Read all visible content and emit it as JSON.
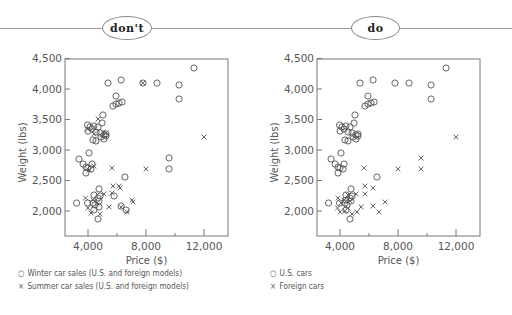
{
  "banner": {
    "left_label": "don't",
    "right_label": "do"
  },
  "colors": {
    "ink": "#555555",
    "axis": "#777777",
    "banner_line": "#9a9a9a"
  },
  "axes": {
    "x_label": "Price ($)",
    "y_label": "Weight (lbs)",
    "x_ticks": [
      "4,000",
      "8,000",
      "12,000"
    ],
    "y_ticks": [
      "2,000",
      "2,500",
      "3,000",
      "3,500",
      "4,000",
      "4,500"
    ]
  },
  "legends": {
    "left": [
      {
        "symbol": "○",
        "text": "Winter car sales (U.S. and foreign models)"
      },
      {
        "symbol": "×",
        "text": "Summer car sales (U.S. and foreign models)"
      }
    ],
    "right": [
      {
        "symbol": "○",
        "text": "U.S. cars"
      },
      {
        "symbol": "×",
        "text": "Foreign cars"
      }
    ]
  },
  "chart_data": [
    {
      "type": "scatter",
      "panel": "don't",
      "title": "",
      "xlabel": "Price ($)",
      "ylabel": "Weight (lbs)",
      "xlim": [
        2600,
        13600
      ],
      "ylim": [
        1600,
        4500
      ],
      "x_ticks": [
        4000,
        8000,
        12000
      ],
      "x_minor_ticks": [
        6000,
        10000
      ],
      "y_ticks": [
        2000,
        2500,
        3000,
        3500,
        4000,
        4500
      ],
      "grid": false,
      "legend_position": "below",
      "series": [
        {
          "name": "Winter car sales (U.S. and foreign models)",
          "marker": "circle",
          "points": [
            [
              11310,
              4344
            ],
            [
              7790,
              4098
            ],
            [
              8760,
              4098
            ],
            [
              10280,
              4066
            ],
            [
              10280,
              3836
            ],
            [
              5380,
              4098
            ],
            [
              6280,
              4148
            ],
            [
              5930,
              3885
            ],
            [
              5720,
              3721
            ],
            [
              5930,
              3754
            ],
            [
              6140,
              3770
            ],
            [
              6350,
              3787
            ],
            [
              5030,
              3574
            ],
            [
              4970,
              3443
            ],
            [
              3970,
              3410
            ],
            [
              4140,
              3377
            ],
            [
              4410,
              3394
            ],
            [
              4690,
              3377
            ],
            [
              4000,
              3311
            ],
            [
              4280,
              3344
            ],
            [
              4550,
              3295
            ],
            [
              4830,
              3279
            ],
            [
              5100,
              3246
            ],
            [
              5240,
              3262
            ],
            [
              5240,
              3230
            ],
            [
              4900,
              3213
            ],
            [
              5100,
              3180
            ],
            [
              4550,
              3148
            ],
            [
              4340,
              3164
            ],
            [
              4070,
              2951
            ],
            [
              3380,
              2852
            ],
            [
              3660,
              2770
            ],
            [
              3860,
              2721
            ],
            [
              4000,
              2705
            ],
            [
              3860,
              2623
            ],
            [
              4210,
              2689
            ],
            [
              4280,
              2770
            ],
            [
              6550,
              2557
            ],
            [
              4760,
              2361
            ],
            [
              4410,
              2262
            ],
            [
              4690,
              2213
            ],
            [
              4830,
              2246
            ],
            [
              3970,
              2131
            ],
            [
              4340,
              2131
            ],
            [
              4480,
              2098
            ],
            [
              4760,
              2164
            ],
            [
              4410,
              2016
            ],
            [
              4690,
              1869
            ],
            [
              9590,
              2689
            ],
            [
              9590,
              2869
            ],
            [
              3210,
              2131
            ],
            [
              6280,
              2082
            ],
            [
              5800,
              2246
            ],
            [
              6630,
              2016
            ],
            [
              4760,
              2066
            ]
          ]
        },
        {
          "name": "Summer car sales (U.S. and foreign models)",
          "marker": "x",
          "points": [
            [
              12000,
              3213
            ],
            [
              8000,
              2689
            ],
            [
              7790,
              4098
            ],
            [
              4690,
              3508
            ],
            [
              3970,
              3344
            ],
            [
              4410,
              3262
            ],
            [
              5030,
              3295
            ],
            [
              5720,
              2410
            ],
            [
              5650,
              2705
            ],
            [
              6140,
              2410
            ],
            [
              5650,
              2295
            ],
            [
              6210,
              2377
            ],
            [
              7030,
              2180
            ],
            [
              5450,
              2066
            ],
            [
              3830,
              2213
            ],
            [
              4000,
              2049
            ],
            [
              4210,
              1967
            ],
            [
              4630,
              2131
            ],
            [
              4830,
              1951
            ],
            [
              5100,
              2279
            ],
            [
              6280,
              2066
            ],
            [
              6690,
              1984
            ],
            [
              7100,
              2148
            ],
            [
              4340,
              2180
            ],
            [
              4070,
              2672
            ],
            [
              4410,
              2738
            ],
            [
              5240,
              3279
            ]
          ]
        }
      ]
    },
    {
      "type": "scatter",
      "panel": "do",
      "title": "",
      "xlabel": "Price ($)",
      "ylabel": "Weight (lbs)",
      "xlim": [
        2600,
        13600
      ],
      "ylim": [
        1600,
        4500
      ],
      "x_ticks": [
        4000,
        8000,
        12000
      ],
      "x_minor_ticks": [
        6000,
        10000
      ],
      "y_ticks": [
        2000,
        2500,
        3000,
        3500,
        4000,
        4500
      ],
      "grid": false,
      "legend_position": "below",
      "series": [
        {
          "name": "U.S. cars",
          "marker": "circle",
          "points": [
            [
              11310,
              4344
            ],
            [
              7790,
              4098
            ],
            [
              8760,
              4098
            ],
            [
              10280,
              4066
            ],
            [
              10280,
              3836
            ],
            [
              5380,
              4098
            ],
            [
              6280,
              4148
            ],
            [
              5930,
              3885
            ],
            [
              5720,
              3721
            ],
            [
              5930,
              3754
            ],
            [
              6140,
              3770
            ],
            [
              6350,
              3787
            ],
            [
              5030,
              3574
            ],
            [
              4970,
              3443
            ],
            [
              3970,
              3410
            ],
            [
              4140,
              3377
            ],
            [
              4410,
              3394
            ],
            [
              4690,
              3377
            ],
            [
              4000,
              3311
            ],
            [
              4280,
              3344
            ],
            [
              4550,
              3295
            ],
            [
              4830,
              3279
            ],
            [
              5100,
              3246
            ],
            [
              5240,
              3262
            ],
            [
              5240,
              3230
            ],
            [
              4900,
              3213
            ],
            [
              5100,
              3180
            ],
            [
              4550,
              3148
            ],
            [
              4340,
              3164
            ],
            [
              4070,
              2951
            ],
            [
              3380,
              2852
            ],
            [
              3660,
              2770
            ],
            [
              3860,
              2721
            ],
            [
              4000,
              2705
            ],
            [
              3860,
              2623
            ],
            [
              4210,
              2689
            ],
            [
              4280,
              2770
            ],
            [
              6550,
              2557
            ],
            [
              4760,
              2361
            ],
            [
              4410,
              2262
            ],
            [
              4690,
              2213
            ],
            [
              4830,
              2246
            ],
            [
              3970,
              2131
            ],
            [
              4340,
              2131
            ],
            [
              4480,
              2098
            ],
            [
              4760,
              2164
            ],
            [
              4410,
              2016
            ],
            [
              4690,
              1869
            ],
            [
              3210,
              2131
            ],
            [
              4410,
              2180
            ]
          ]
        },
        {
          "name": "Foreign cars",
          "marker": "x",
          "points": [
            [
              12000,
              3213
            ],
            [
              8000,
              2689
            ],
            [
              9590,
              2869
            ],
            [
              9590,
              2689
            ],
            [
              5650,
              2705
            ],
            [
              5720,
              2410
            ],
            [
              6280,
              2377
            ],
            [
              5720,
              2279
            ],
            [
              5100,
              2279
            ],
            [
              4550,
              2262
            ],
            [
              5450,
              2066
            ],
            [
              6280,
              2082
            ],
            [
              6690,
              1984
            ],
            [
              7100,
              2148
            ],
            [
              3860,
              2213
            ],
            [
              4070,
              2131
            ],
            [
              3830,
              2049
            ],
            [
              4000,
              1984
            ],
            [
              4830,
              1951
            ],
            [
              4550,
              2049
            ],
            [
              4340,
              2000
            ],
            [
              5170,
              1984
            ],
            [
              4280,
              2180
            ],
            [
              4690,
              2164
            ]
          ]
        }
      ]
    }
  ]
}
